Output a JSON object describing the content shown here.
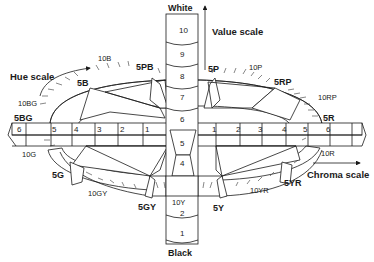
{
  "diagram": {
    "axes": {
      "value": {
        "label": "Value scale",
        "top_label": "White",
        "bottom_label": "Black",
        "ticks_upper": [
          "10",
          "9",
          "8",
          "7",
          "6"
        ],
        "ticks_lower": [
          "5",
          "4"
        ],
        "ticks_bottom": [
          "2",
          "1"
        ]
      },
      "hue": {
        "label": "Hue scale"
      },
      "chroma": {
        "label": "Chroma scale",
        "left_ticks": [
          "6",
          "5",
          "4",
          "3",
          "2",
          "1"
        ],
        "right_ticks": [
          "1",
          "2",
          "3",
          "4",
          "5",
          "6"
        ]
      }
    },
    "hue_labels": {
      "h_10B": "10B",
      "h_5PB": "5PB",
      "h_5P": "5P",
      "h_10P": "10P",
      "h_5RP": "5RP",
      "h_10RP": "10RP",
      "h_5R": "5R",
      "h_10R": "10R",
      "h_5YR": "5YR",
      "h_10YR": "10YR",
      "h_5Y": "5Y",
      "h_10Y": "10Y",
      "h_5GY": "5GY",
      "h_10GY": "10GY",
      "h_5G": "5G",
      "h_10G": "10G",
      "h_5BG": "5BG",
      "h_10BG": "10BG",
      "h_5B": "5B"
    },
    "colors": {
      "ink": "#1a1a1a",
      "background": "#ffffff"
    }
  }
}
